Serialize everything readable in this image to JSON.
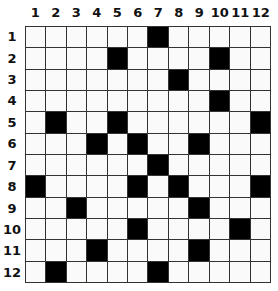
{
  "puzzle": {
    "columns": [
      "1",
      "2",
      "3",
      "4",
      "5",
      "6",
      "7",
      "8",
      "9",
      "10",
      "11",
      "12"
    ],
    "rows": [
      "1",
      "2",
      "3",
      "4",
      "5",
      "6",
      "7",
      "8",
      "9",
      "10",
      "11",
      "12"
    ],
    "black_cells": [
      [
        7
      ],
      [
        5,
        10
      ],
      [
        8
      ],
      [
        10
      ],
      [
        2,
        5,
        12
      ],
      [
        4,
        6,
        9
      ],
      [
        7
      ],
      [
        1,
        6,
        8,
        12
      ],
      [
        3,
        9
      ],
      [
        6,
        11
      ],
      [
        4,
        9
      ],
      [
        2,
        7
      ]
    ]
  }
}
